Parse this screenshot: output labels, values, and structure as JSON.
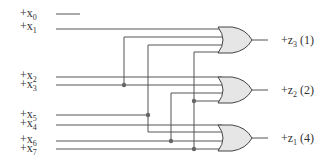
{
  "diagram": {
    "type": "logic-circuit",
    "inputs": [
      {
        "id": "x0",
        "label": "+x",
        "sub": "0",
        "y": 14
      },
      {
        "id": "x1",
        "label": "+x",
        "sub": "1",
        "y": 29
      },
      {
        "id": "x2",
        "label": "+x",
        "sub": "2",
        "y": 77
      },
      {
        "id": "x3",
        "label": "+x",
        "sub": "3",
        "y": 85
      },
      {
        "id": "x5",
        "label": "+x",
        "sub": "5",
        "y": 115
      },
      {
        "id": "x4",
        "label": "+x",
        "sub": "4",
        "y": 125
      },
      {
        "id": "x6",
        "label": "+x",
        "sub": "6",
        "y": 141
      },
      {
        "id": "x7",
        "label": "+x",
        "sub": "7",
        "y": 149
      }
    ],
    "gates": [
      {
        "id": "gate-z3",
        "type": "OR",
        "output_label": "+z",
        "output_sub": "3",
        "output_note": "(1)",
        "y": 40
      },
      {
        "id": "gate-z2",
        "type": "OR",
        "output_label": "+z",
        "output_sub": "2",
        "output_note": "(2)",
        "y": 90
      },
      {
        "id": "gate-z1",
        "type": "OR",
        "output_label": "+z",
        "output_sub": "1",
        "output_note": "(4)",
        "y": 138
      }
    ],
    "colors": {
      "wire": "#555555",
      "gate_fill": "#e6e6e6",
      "gate_stroke": "#444444",
      "junction": "#666666",
      "text": "#333333"
    }
  }
}
